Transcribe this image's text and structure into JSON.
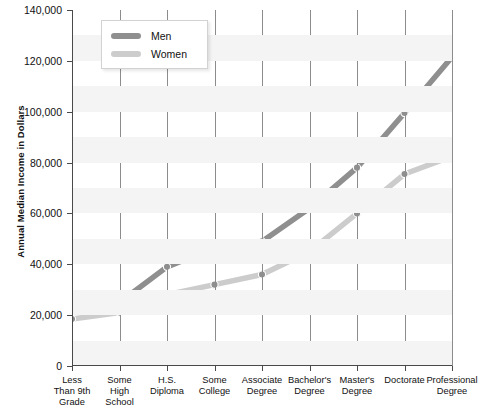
{
  "chart_data": {
    "type": "line",
    "title": "",
    "xlabel": "",
    "ylabel": "Annual Median Income in Dollars",
    "categories": [
      "Less Than 9th Grade",
      "Some High School",
      "H.S. Diploma",
      "Some College",
      "Associate Degree",
      "Bachelor's Degree",
      "Master's Degree",
      "Doctorate",
      "Professional Degree"
    ],
    "category_lines": [
      [
        "Less",
        "Than 9th",
        "Grade"
      ],
      [
        "Some",
        "High",
        "School"
      ],
      [
        "H.S.",
        "Diploma"
      ],
      [
        "Some",
        "College"
      ],
      [
        "Associate",
        "Degree"
      ],
      [
        "Bachelor's",
        "Degree"
      ],
      [
        "Master's",
        "Degree"
      ],
      [
        "Doctorate"
      ],
      [
        "Professional",
        "Degree"
      ]
    ],
    "series": [
      {
        "name": "Men",
        "color": "#8f8f8f",
        "values": [
          24000,
          25000,
          39000,
          46500,
          49000,
          62000,
          78000,
          99500,
          121500
        ]
      },
      {
        "name": "Women",
        "color": "#cccccc",
        "values": [
          18500,
          21000,
          28000,
          32000,
          36000,
          45000,
          60000,
          75500,
          82500
        ]
      }
    ],
    "ylim": [
      0,
      140000
    ],
    "ytick_values": [
      0,
      20000,
      40000,
      60000,
      80000,
      100000,
      120000,
      140000
    ],
    "ytick_labels": [
      "0",
      "20,000",
      "40,000",
      "60,000",
      "80,000",
      "100,000",
      "120,000",
      "140,000"
    ],
    "grid": "vertical-lines-and-horizontal-bands",
    "legend_position": "top-left-inside",
    "legend_entries": [
      "Men",
      "Women"
    ],
    "marker": "circle",
    "marker_color": "#8f8f8f"
  }
}
